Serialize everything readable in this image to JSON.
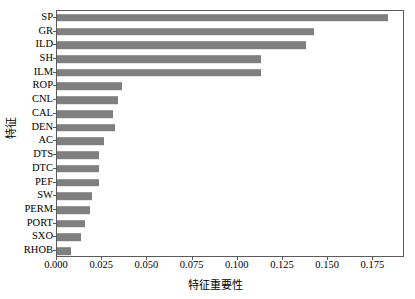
{
  "chart_data": {
    "type": "bar",
    "orientation": "horizontal",
    "title": "",
    "xlabel": "特征重要性",
    "ylabel": "特征",
    "xlim": [
      0.0,
      0.1925
    ],
    "xticks": [
      0.0,
      0.025,
      0.05,
      0.075,
      0.1,
      0.125,
      0.15,
      0.175
    ],
    "xticklabels": [
      "0.000",
      "0.025",
      "0.050",
      "0.075",
      "0.100",
      "0.125",
      "0.150",
      "0.175"
    ],
    "grid": false,
    "legend": null,
    "bar_color": "#7f7f7f",
    "categories": [
      "SP",
      "GR",
      "ILD",
      "SH",
      "ILM",
      "ROP",
      "CNL",
      "CAL",
      "DEN",
      "AC",
      "DTS",
      "DTC",
      "PEF",
      "SW",
      "PERM",
      "PORT",
      "SXO",
      "RHOB"
    ],
    "values": [
      0.183,
      0.142,
      0.138,
      0.113,
      0.113,
      0.036,
      0.034,
      0.031,
      0.032,
      0.026,
      0.023,
      0.023,
      0.023,
      0.0195,
      0.018,
      0.0155,
      0.0135,
      0.0075
    ]
  }
}
